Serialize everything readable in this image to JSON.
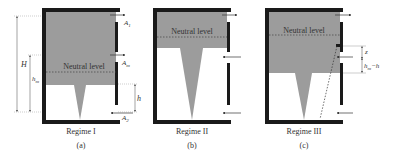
{
  "colors": {
    "wall": "#1a1a1a",
    "smoke": "#9c9c9c",
    "text": "#333333",
    "guide": "#9a9a9a"
  },
  "panels": [
    {
      "id": "a",
      "regime": "Regime I",
      "caption": "(a)",
      "neutral_label": "Neutral level",
      "dimensions": {
        "H": "H",
        "hm": "h",
        "hm_sub": "m",
        "h": "h"
      },
      "openings": {
        "A1": "A",
        "A1_sub": "1",
        "Am": "A",
        "Am_sub": "m",
        "A2": "A",
        "A2_sub": "2"
      }
    },
    {
      "id": "b",
      "regime": "Regime II",
      "caption": "(b)",
      "neutral_label": "Neutral level"
    },
    {
      "id": "c",
      "regime": "Regime III",
      "caption": "(c)",
      "neutral_label": "Neutral level",
      "dimensions": {
        "z": "z",
        "hm_minus_h": "h",
        "hm_minus_h_sub": "m",
        "hm_minus_h_tail": "−h"
      }
    }
  ]
}
